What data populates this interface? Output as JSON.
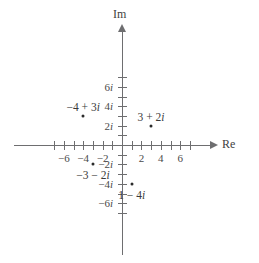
{
  "chart_data": {
    "type": "scatter",
    "title": "",
    "subtitle": "",
    "xlabel": "Re",
    "ylabel": "Im",
    "xlim": [
      -7,
      7
    ],
    "ylim": [
      -7,
      7
    ],
    "grid": false,
    "legend": "none",
    "x_tick_values": [
      -7,
      -6,
      -5,
      -4,
      -3,
      -2,
      -1,
      1,
      2,
      3,
      4,
      5,
      6,
      7
    ],
    "y_tick_values": [
      -7,
      -6,
      -5,
      -4,
      -3,
      -2,
      -1,
      1,
      2,
      3,
      4,
      5,
      6,
      7
    ],
    "x_tick_labels": [
      {
        "value": -6,
        "text": "−6"
      },
      {
        "value": -4,
        "text": "−4"
      },
      {
        "value": -2,
        "text": "−2"
      },
      {
        "value": 2,
        "text": "2"
      },
      {
        "value": 4,
        "text": "4"
      },
      {
        "value": 6,
        "text": "6"
      }
    ],
    "y_tick_labels": [
      {
        "value": 6,
        "text": "6i"
      },
      {
        "value": 4,
        "text": "4i"
      },
      {
        "value": 2,
        "text": "2i"
      },
      {
        "value": -2,
        "text": "−2i"
      },
      {
        "value": -4,
        "text": "−4i"
      },
      {
        "value": -6,
        "text": "−6i"
      }
    ],
    "points": [
      {
        "name": "minus-4-plus-3i",
        "re": -4,
        "im": 3,
        "label": "−4 + 3i",
        "label_position": "above"
      },
      {
        "name": "3-plus-2i",
        "re": 3,
        "im": 2,
        "label": "3 + 2i",
        "label_position": "above"
      },
      {
        "name": "minus-3-minus-2i",
        "re": -3,
        "im": -2,
        "label": "−3 − 2i",
        "label_position": "below"
      },
      {
        "name": "1-minus-4i",
        "re": 1,
        "im": -4,
        "label": "1 − 4i",
        "label_position": "below"
      }
    ],
    "colors": {
      "axis": "#6e6e70",
      "point": "#2b2b2b",
      "text": "#3a3a3a",
      "background": "#ffffff"
    }
  }
}
